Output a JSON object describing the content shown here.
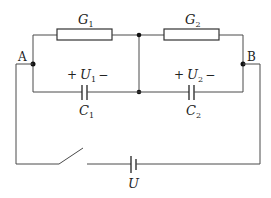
{
  "diagram": {
    "type": "circuit",
    "nodes": {
      "A": "A",
      "B": "B"
    },
    "resistors": [
      {
        "id": "G1",
        "symbol": "G",
        "sub": "1"
      },
      {
        "id": "G2",
        "symbol": "G",
        "sub": "2"
      }
    ],
    "capacitors": [
      {
        "id": "C1",
        "symbol": "C",
        "sub": "1",
        "voltage_symbol": "U",
        "voltage_sub": "1",
        "plus": "+",
        "minus": "−"
      },
      {
        "id": "C2",
        "symbol": "C",
        "sub": "2",
        "voltage_symbol": "U",
        "voltage_sub": "2",
        "plus": "+",
        "minus": "−"
      }
    ],
    "source": {
      "id": "U",
      "symbol": "U"
    },
    "switch": {
      "id": "S",
      "state": "open"
    },
    "wire_color": "#4a4a4a"
  }
}
